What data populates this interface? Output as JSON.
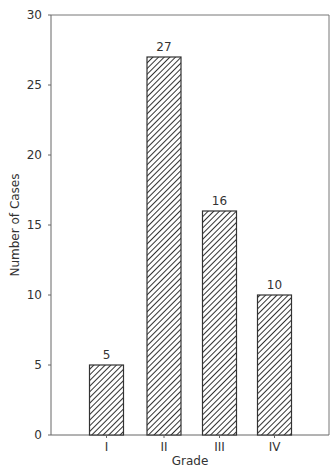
{
  "chart_data": {
    "type": "bar",
    "title": "",
    "xlabel": "Grade",
    "ylabel": "Number of Cases",
    "categories": [
      "I",
      "II",
      "III",
      "IV"
    ],
    "values": [
      5,
      27,
      16,
      10
    ],
    "data_labels": [
      "5",
      "27",
      "16",
      "10"
    ],
    "ylim": [
      0,
      30
    ],
    "yticks": [
      0,
      5,
      10,
      15,
      20,
      25,
      30
    ],
    "grid": false,
    "legend": null,
    "bar_fill": "diagonal-hatch",
    "colors": {
      "bar_stroke": "#333333",
      "hatch": "#333333",
      "axis": "#666666",
      "background": "#ffffff"
    }
  }
}
